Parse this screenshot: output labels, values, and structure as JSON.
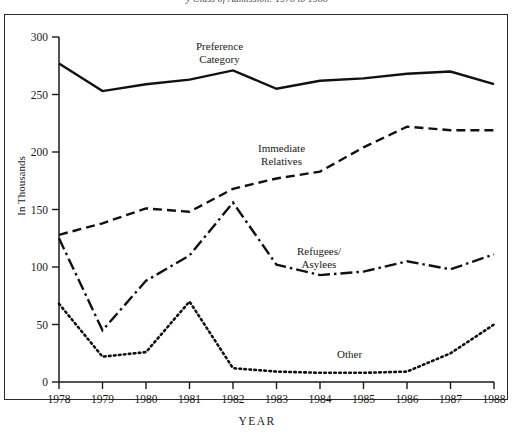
{
  "caption": "y  Class of Admission: 1978 to 1988",
  "axis": {
    "ylabel": "In Thousands",
    "xlabel": "YEAR",
    "yticks": [
      "0",
      "50",
      "100",
      "150",
      "200",
      "250",
      "300"
    ],
    "xticks": [
      "1978",
      "1979",
      "1980",
      "1981",
      "1982",
      "1983",
      "1984",
      "1985",
      "1986",
      "1987",
      "1988"
    ]
  },
  "series_labels": {
    "preference": "Preference\nCategory",
    "preference_line1": "Preference",
    "preference_line2": "Category",
    "immediate_line1": "Immediate",
    "immediate_line2": "Relatives",
    "refugees_line1": "Refugees/",
    "refugees_line2": "Asylees",
    "other": "Other"
  },
  "chart_data": {
    "type": "line",
    "title": "y  Class of Admission: 1978 to 1988",
    "xlabel": "YEAR",
    "ylabel": "In Thousands",
    "x": [
      1978,
      1979,
      1980,
      1981,
      1982,
      1983,
      1984,
      1985,
      1986,
      1987,
      1988
    ],
    "xlim": [
      1978,
      1988
    ],
    "ylim": [
      0,
      300
    ],
    "ytick_step": 50,
    "grid": false,
    "legend": "inline-annotations",
    "series": [
      {
        "name": "Preference Category",
        "style": "solid",
        "color": "#111111",
        "values": [
          277,
          253,
          259,
          263,
          271,
          255,
          262,
          264,
          268,
          270,
          259
        ]
      },
      {
        "name": "Immediate Relatives",
        "style": "dashed",
        "color": "#111111",
        "values": [
          128,
          138,
          151,
          148,
          168,
          177,
          183,
          204,
          222,
          219,
          219
        ]
      },
      {
        "name": "Refugees/Asylees",
        "style": "dash-dot",
        "color": "#111111",
        "values": [
          125,
          45,
          88,
          110,
          156,
          102,
          93,
          96,
          105,
          98,
          111
        ]
      },
      {
        "name": "Other",
        "style": "dotted",
        "color": "#111111",
        "values": [
          68,
          22,
          26,
          70,
          12,
          9,
          8,
          8,
          9,
          25,
          50
        ]
      }
    ]
  }
}
